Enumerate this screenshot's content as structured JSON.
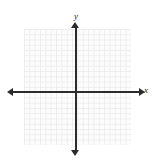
{
  "figure": {
    "kind": "coordinate-plane",
    "width": 155,
    "height": 165,
    "background_color": "#ffffff",
    "top_text_band": {
      "text": "— —— —  —   ——  —",
      "color": "#d9d9dd",
      "note_visible": "faint clipped glyph tops, illegible"
    },
    "grid": {
      "visible": true,
      "cell_size_px": 5.3,
      "line_color": "#ededf0",
      "fill_color": "#fcfcfc",
      "left": 24,
      "top": 29,
      "width": 107,
      "height": 116,
      "columns": 20,
      "rows": 22
    },
    "axes": {
      "color": "#2b2b2b",
      "line_width_px": 1.6,
      "origin": {
        "x": 76,
        "y": 92
      },
      "x_axis": {
        "label": "x",
        "label_style": "italic",
        "start_x": 7,
        "end_x": 145,
        "y": 92,
        "arrow_left": true,
        "arrow_right": true,
        "ticks": [],
        "tick_labels": []
      },
      "y_axis": {
        "label": "y",
        "label_style": "italic",
        "start_y": 22,
        "end_y": 156,
        "x": 76,
        "arrow_top": true,
        "arrow_bottom": true,
        "ticks": [],
        "tick_labels": []
      }
    },
    "plotted_data": {
      "points": [],
      "curves": [],
      "annotations": []
    }
  },
  "chart_data": {
    "type": "scatter",
    "title": "",
    "subtitle": "",
    "xlabel": "x",
    "ylabel": "y",
    "xlim": [
      -10,
      10
    ],
    "ylim": [
      -11,
      11
    ],
    "grid": true,
    "legend": null,
    "x": [],
    "y": [],
    "series": [],
    "tick_labels_x": [],
    "tick_labels_y": [],
    "annotations": [],
    "note": "Empty/blank coordinate plane - axes and grid only, no plotted data"
  }
}
